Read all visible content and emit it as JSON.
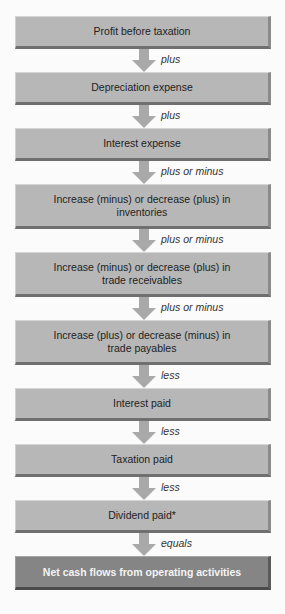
{
  "diagram": {
    "steps": [
      {
        "label": "Profit before taxation",
        "operator": "plus"
      },
      {
        "label": "Depreciation expense",
        "operator": "plus"
      },
      {
        "label": "Interest expense",
        "operator": "plus or minus"
      },
      {
        "label": "Increase (minus) or decrease (plus) in inventories",
        "line1": "Increase (minus) or decrease (plus) in",
        "line2": "inventories",
        "operator": "plus or minus"
      },
      {
        "label": "Increase (minus) or decrease (plus) in trade receivables",
        "line1": "Increase (minus) or decrease (plus) in",
        "line2": "trade receivables",
        "operator": "plus or minus"
      },
      {
        "label": "Increase (plus) or decrease (minus) in trade payables",
        "line1": "Increase (plus) or decrease (minus) in",
        "line2": "trade payables",
        "operator": "less"
      },
      {
        "label": "Interest paid",
        "operator": "less"
      },
      {
        "label": "Taxation paid",
        "operator": "less"
      },
      {
        "label": "Dividend paid*",
        "operator": "equals"
      },
      {
        "label": "Net cash flows from operating activities"
      }
    ],
    "colors": {
      "box_fill": "#b7b7b7",
      "final_box_fill": "#858585",
      "arrow": "#a9a9a9",
      "final_text": "#f4f4f4"
    }
  }
}
